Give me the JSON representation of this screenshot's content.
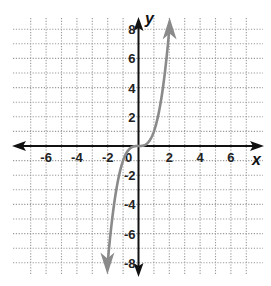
{
  "chart_data": {
    "type": "line",
    "title": "",
    "xlabel": "x",
    "ylabel": "y",
    "xlim": [
      -7,
      7
    ],
    "ylim": [
      -8,
      8
    ],
    "grid": true,
    "grid_style": "dotted",
    "x_ticks": [
      -6,
      -4,
      -2,
      0,
      2,
      4,
      6
    ],
    "y_ticks": [
      8,
      6,
      4,
      2,
      -2,
      -4,
      -6,
      -8
    ],
    "x_tick_labels": [
      "-6",
      "-4",
      "-2",
      "0",
      "2",
      "4",
      "6"
    ],
    "y_tick_labels": [
      "8",
      "6",
      "4",
      "2",
      "-2",
      "-4",
      "-6",
      "-8"
    ],
    "series": [
      {
        "name": "y = x^3",
        "color": "#8a8a8a",
        "arrows": "both",
        "x": [
          -2.05,
          -2,
          -1.5,
          -1,
          -0.5,
          0,
          0.5,
          1,
          1.5,
          2,
          2.05
        ],
        "y": [
          -8.6,
          -8,
          -3.375,
          -1,
          -0.125,
          0,
          0.125,
          1,
          3.375,
          8,
          8.6
        ]
      }
    ],
    "legend": null
  },
  "labels": {
    "x_axis": "x",
    "y_axis": "y"
  },
  "colors": {
    "axis": "#111111",
    "grid": "#9a9a9a",
    "curve": "#8a8a8a"
  }
}
